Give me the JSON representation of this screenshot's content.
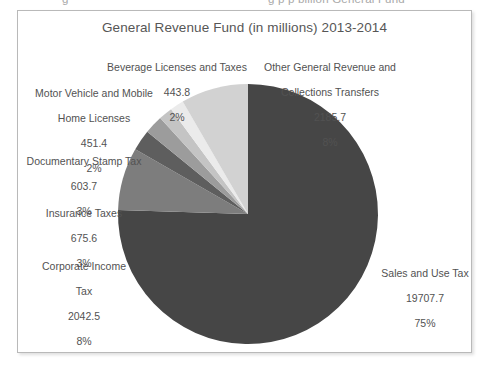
{
  "scan": {
    "top_cropped_line_left": "g",
    "top_cropped_line_right": "g p  p  billion General Fund"
  },
  "chart_data": {
    "type": "pie",
    "title": "General Revenue Fund (in millions) 2013-2014",
    "units": "millions",
    "period": "2013-2014",
    "start_angle_deg": 0,
    "direction": "clockwise",
    "legend": "none",
    "labels_position": "outside-with-leader-free",
    "categories": [
      "Sales and Use Tax",
      "Corporate Income Tax",
      "Insurance Taxes",
      "Documentary Stamp Tax",
      "Motor Vehicle and Mobile Home Licenses",
      "Beverage Licenses and Taxes",
      "Other General Revenue and Collections Transfers"
    ],
    "values": [
      19707.7,
      2042.5,
      675.6,
      603.7,
      451.4,
      443.8,
      2185.7
    ],
    "percents": [
      75,
      8,
      3,
      3,
      2,
      2,
      8
    ],
    "colors": [
      "#464646",
      "#7d7d7d",
      "#5e5e5e",
      "#9c9c9c",
      "#c4c4c4",
      "#ebebeb",
      "#d2d2d2"
    ],
    "slices": [
      {
        "name": "Sales and Use Tax",
        "value": "19707.7",
        "percent": "75%",
        "color": "#464646",
        "label_lines": [
          "Sales and Use Tax",
          "19707.7",
          "75%"
        ]
      },
      {
        "name": "Corporate Income Tax",
        "value": "2042.5",
        "percent": "8%",
        "color": "#7d7d7d",
        "label_lines": [
          "Corporate Income",
          "Tax",
          "2042.5",
          "8%"
        ]
      },
      {
        "name": "Insurance Taxes",
        "value": "675.6",
        "percent": "3%",
        "color": "#5e5e5e",
        "label_lines": [
          "Insurance Taxes",
          "675.6",
          "3%"
        ]
      },
      {
        "name": "Documentary Stamp Tax",
        "value": "603.7",
        "percent": "3%",
        "color": "#9c9c9c",
        "label_lines": [
          "Documentary Stamp Tax",
          "603.7",
          "3%"
        ]
      },
      {
        "name": "Motor Vehicle and Mobile Home Licenses",
        "value": "451.4",
        "percent": "2%",
        "color": "#c4c4c4",
        "label_lines": [
          "Motor Vehicle and Mobile",
          "Home Licenses",
          "451.4",
          "2%"
        ]
      },
      {
        "name": "Beverage Licenses and Taxes",
        "value": "443.8",
        "percent": "2%",
        "color": "#ebebeb",
        "label_lines": [
          "Beverage Licenses and Taxes",
          "443.8",
          "2%"
        ]
      },
      {
        "name": "Other General Revenue and Collections Transfers",
        "value": "2185.7",
        "percent": "8%",
        "color": "#d2d2d2",
        "label_lines": [
          "Other General Revenue and",
          "Collections Transfers",
          "2185.7",
          "8%"
        ]
      }
    ]
  },
  "labels": {
    "beverage": {
      "line1": "Beverage Licenses and Taxes",
      "line2": "443.8",
      "line3": "2%"
    },
    "motor_vehicle": {
      "line1": "Motor Vehicle and Mobile",
      "line2": "Home Licenses",
      "line3": "451.4",
      "line4": "2%"
    },
    "documentary_stamp": {
      "line1": "Documentary Stamp Tax",
      "line2": "603.7",
      "line3": "3%"
    },
    "insurance": {
      "line1": "Insurance Taxes",
      "line2": "675.6",
      "line3": "3%"
    },
    "corporate_income": {
      "line1": "Corporate Income",
      "line2": "Tax",
      "line3": "2042.5",
      "line4": "8%"
    },
    "other_general": {
      "line1": "Other General Revenue and",
      "line2": "Collections Transfers",
      "line3": "2185.7",
      "line4": "8%"
    },
    "sales_use": {
      "line1": "Sales and Use Tax",
      "line2": "19707.7",
      "line3": "75%"
    }
  }
}
